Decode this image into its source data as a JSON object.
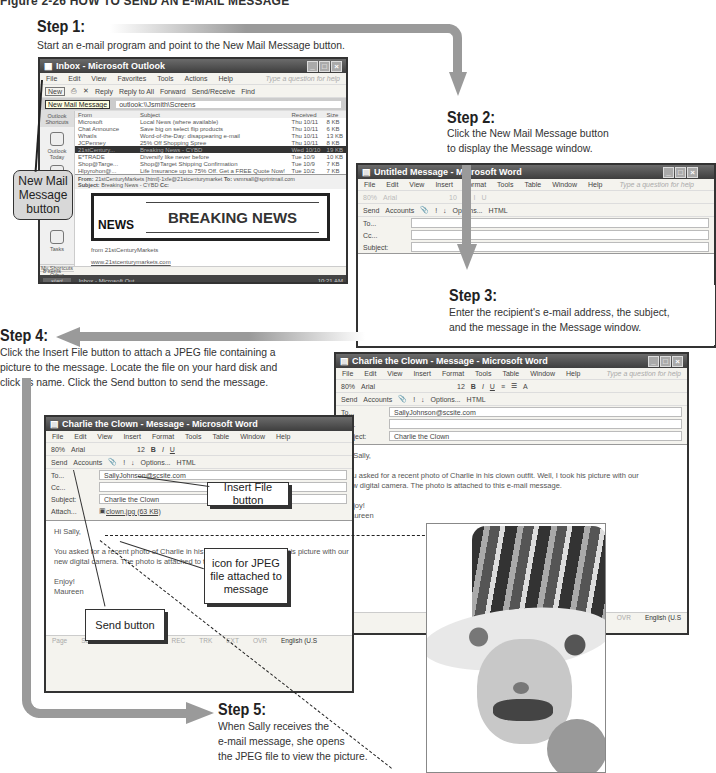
{
  "figure_title": "Figure 2-26 HOW TO SEND AN E-MAIL MESSAGE",
  "steps": [
    {
      "heading": "Step 1:",
      "text": "Start an e-mail program and point to the New Mail Message button."
    },
    {
      "heading": "Step 2:",
      "text_line1": "Click the New Mail Message button",
      "text_line2": "to display the Message window."
    },
    {
      "heading": "Step 3:",
      "text_line1": "Enter the recipient's e-mail address, the subject,",
      "text_line2": "and the message in the Message window."
    },
    {
      "heading": "Step 4:",
      "text_line1": "Click the Insert File button to attach a JPEG file containing a",
      "text_line2": "picture to the message. Locate the file on your hard disk and",
      "text_line3": "click its name. Click the Send button to send the message."
    },
    {
      "heading": "Step 5:",
      "text_line1": "When Sally receives the",
      "text_line2": "e-mail message, she opens",
      "text_line3": "the JPEG file to view the picture."
    }
  ],
  "callouts": {
    "new_mail": [
      "New Mail",
      "Message",
      "button"
    ],
    "insert_file": "Insert File button",
    "jpeg_icon": [
      "icon for JPEG",
      "file attached to",
      "message"
    ],
    "send": "Send button"
  },
  "outlook": {
    "title": "Inbox - Microsoft Outlook",
    "menu": [
      "File",
      "Edit",
      "View",
      "Favorites",
      "Tools",
      "Actions",
      "Help"
    ],
    "help_placeholder": "Type a question for help",
    "toolbar": [
      "New",
      "Reply",
      "Reply to All",
      "Forward",
      "Send/Receive",
      "Find"
    ],
    "tooltip": "New Mail Message",
    "address": "outlook:\\\\Jsmith\\Screens",
    "shortcuts_header": "Outlook Shortcuts",
    "shortcuts": [
      "Outlook Today",
      "Inbox",
      "Tasks"
    ],
    "shortcut_groups": [
      "My Shortcuts",
      "Other Shortcuts"
    ],
    "columns": [
      "From",
      "Subject",
      "Received",
      "Size"
    ],
    "messages": [
      {
        "from": "Microsoft",
        "subject": "Local News (where available)",
        "received": "Thu 10/11",
        "size": "8 KB"
      },
      {
        "from": "Chat Announce",
        "subject": "Save big on select flip products",
        "received": "Thu 10/11",
        "size": "6 KB"
      },
      {
        "from": "WhatIs",
        "subject": "Word-of-the-Day: disappearing e-mail",
        "received": "Thu 10/11",
        "size": "13 KB"
      },
      {
        "from": "JCPenney",
        "subject": "25% Off Shopping Spree",
        "received": "Thu 10/11",
        "size": "8 KB"
      },
      {
        "from": "21stCentury...",
        "subject": "Breaking News - CYBD",
        "received": "Wed 10/10",
        "size": "19 KB"
      },
      {
        "from": "E*TRADE",
        "subject": "Diversify like never before",
        "received": "Tue 10/9",
        "size": "10 KB"
      },
      {
        "from": "Shop@Targe...",
        "subject": "Shop@Target Shipping Confirmation",
        "received": "Tue 10/9",
        "size": "7 KB"
      },
      {
        "from": "Hlpyrohon@...",
        "subject": "Life Insurance up to 75% Off. Get a FREE Quote Now!",
        "received": "Tue 10/2",
        "size": "7 KB"
      }
    ],
    "preview_from_label": "From:",
    "preview_from": "21stCenturyMarkets [html]-1xfe@21stcenturymarket",
    "preview_to_label": "To:",
    "preview_to": "vsmrsall@sprintmail.com",
    "preview_subject_label": "Subject:",
    "preview_subject": "Breaking News - CYBD",
    "preview_cc_label": "Cc:",
    "banner_logo": "NEWS",
    "banner_text": "BREAKING NEWS",
    "preview_line1": "from 21stCenturyMarkets",
    "preview_link": "www.21stcenturymarkets.com",
    "status": "8 Items",
    "start": "start",
    "taskbar_item": "Inbox - Microsoft Out...",
    "clock": "10:21 AM"
  },
  "untitled_msg": {
    "title": "Untitled Message - Microsoft Word",
    "menu": [
      "File",
      "Edit",
      "View",
      "Insert",
      "Format",
      "Tools",
      "Table",
      "Window",
      "Help"
    ],
    "help_placeholder": "Type a question for help",
    "fmt": [
      "80%",
      "Arial",
      "10",
      "B",
      "I",
      "U"
    ],
    "toolbar": [
      "Send",
      "Accounts",
      "!",
      "↓",
      "Options...",
      "HTML"
    ],
    "to_label": "To...",
    "cc_label": "Cc...",
    "subject_label": "Subject:"
  },
  "charlie_msg": {
    "title": "Charlie the Clown - Message - Microsoft Word",
    "menu": [
      "File",
      "Edit",
      "View",
      "Insert",
      "Format",
      "Tools",
      "Table",
      "Window",
      "Help"
    ],
    "help_placeholder": "Type a question for help",
    "zoom": "80%",
    "font": "Arial",
    "size": "12",
    "toolbar": [
      "Send",
      "Accounts",
      "!",
      "↓",
      "Options...",
      "HTML"
    ],
    "to_label": "To...",
    "to": "SallyJohnson@scsite.com",
    "cc_label": "Cc...",
    "subject_label": "Subject:",
    "subject": "Charlie the Clown",
    "attach_label": "Attach...",
    "attachment": "clown.jpg (63 KB)",
    "greeting": "Hi Sally,",
    "body1": "You asked for a recent photo of Charlie in his clown outfit. Well, I took his picture with our",
    "body2": "new digital camera. The photo is attached to this e-mail message.",
    "closing": "Enjoy!",
    "signature": "Maureen",
    "status": [
      "Page",
      "Sec",
      "At",
      "Ln",
      "Col",
      "REC",
      "TRK",
      "EXT",
      "OVR",
      "English (U.S"
    ]
  },
  "colors": {
    "flow_arrow": "#9a9a9a",
    "titlebar": "#3e3e3e",
    "window_bg": "#f4f3ee"
  }
}
